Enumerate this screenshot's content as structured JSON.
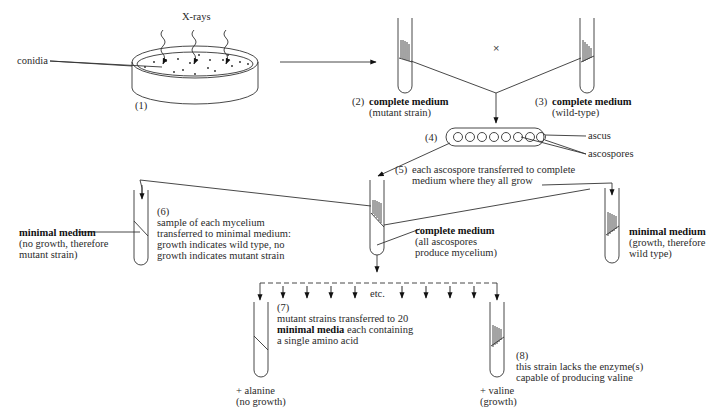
{
  "step1": {
    "number": "(1)",
    "xrays_label": "X-rays",
    "conidia_label": "conidia"
  },
  "step2": {
    "number": "(2)",
    "title": "complete medium",
    "subtitle": "(mutant strain)"
  },
  "cross_symbol": "×",
  "step3": {
    "number": "(3)",
    "title": "complete medium",
    "subtitle": "(wild-type)"
  },
  "step4": {
    "number": "(4)",
    "ascus_label": "ascus",
    "ascospores_label": "ascospores",
    "ascospore_count": 8
  },
  "step5": {
    "number": "(5)",
    "line1": "each ascospore transferred to complete",
    "line2": "medium where they all grow",
    "tube_title": "complete medium",
    "tube_line1": "(all ascospores",
    "tube_line2": "produce mycelium)"
  },
  "step6": {
    "number": "(6)",
    "line1": "sample of each mycelium",
    "line2": "transferred to minimal medium:",
    "line3": "growth indicates wild type, no",
    "line4": "growth indicates mutant strain",
    "left_title": "minimal medium",
    "left_line1": "(no growth, therefore",
    "left_line2": "mutant strain)",
    "right_title": "minimal medium",
    "right_line1": "(growth, therefore",
    "right_line2": "wild type)"
  },
  "step7": {
    "number": "(7)",
    "line1": "mutant strains transferred to 20",
    "line2_bold": "minimal media",
    "line2_rest": " each containing",
    "line3": "a single amino acid",
    "etc_label": "etc.",
    "left_tube_line1": "+ alanine",
    "left_tube_line2": "(no growth)"
  },
  "step8": {
    "number": "(8)",
    "line1": "this strain lacks the enzyme(s)",
    "line2": "capable of producing  valine",
    "tube_line1": "+ valine",
    "tube_line2": "(growth)"
  }
}
